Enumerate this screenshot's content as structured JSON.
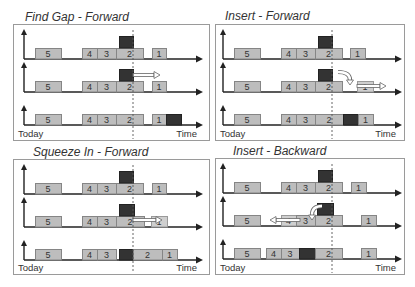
{
  "panels": [
    {
      "id": "find-gap-forward",
      "title": "Find Gap - Forward",
      "today_label": "Today",
      "time_label": "Time",
      "rows": [
        {
          "boxes": [
            {
              "label": "5",
              "x1": 35,
              "x2": 61,
              "type": "task"
            },
            {
              "label": "4",
              "x1": 82,
              "x2": 97,
              "type": "task"
            },
            {
              "label": "3",
              "x1": 97,
              "x2": 116,
              "type": "task"
            },
            {
              "label": "2",
              "x1": 116,
              "x2": 143,
              "type": "task"
            },
            {
              "label": "",
              "x1": 119,
              "x2": 133,
              "type": "new",
              "level": "above"
            },
            {
              "label": "1",
              "x1": 152,
              "x2": 166,
              "type": "task"
            }
          ],
          "arrows": [],
          "curved": []
        },
        {
          "boxes": [
            {
              "label": "5",
              "x1": 35,
              "x2": 61,
              "type": "task"
            },
            {
              "label": "4",
              "x1": 82,
              "x2": 97,
              "type": "task"
            },
            {
              "label": "3",
              "x1": 97,
              "x2": 116,
              "type": "task"
            },
            {
              "label": "2",
              "x1": 116,
              "x2": 143,
              "type": "task"
            },
            {
              "label": "",
              "x1": 119,
              "x2": 133,
              "type": "new",
              "level": "above"
            },
            {
              "label": "1",
              "x1": 152,
              "x2": 166,
              "type": "task"
            }
          ],
          "arrows": [
            {
              "x1": 133,
              "x2": 160,
              "dy": 17,
              "dir": "right"
            }
          ],
          "curved": []
        },
        {
          "boxes": [
            {
              "label": "5",
              "x1": 35,
              "x2": 61,
              "type": "task"
            },
            {
              "label": "4",
              "x1": 82,
              "x2": 97,
              "type": "task"
            },
            {
              "label": "3",
              "x1": 97,
              "x2": 116,
              "type": "task"
            },
            {
              "label": "2",
              "x1": 116,
              "x2": 143,
              "type": "task"
            },
            {
              "label": "1",
              "x1": 152,
              "x2": 166,
              "type": "task"
            },
            {
              "label": "",
              "x1": 166,
              "x2": 181,
              "type": "new"
            }
          ],
          "arrows": [],
          "curved": []
        }
      ]
    },
    {
      "id": "insert-forward",
      "title": "Insert - Forward",
      "today_label": "Today",
      "time_label": "Time",
      "rows": [
        {
          "boxes": [
            {
              "label": "5",
              "x1": 35,
              "x2": 61,
              "type": "task"
            },
            {
              "label": "4",
              "x1": 82,
              "x2": 97,
              "type": "task"
            },
            {
              "label": "3",
              "x1": 97,
              "x2": 116,
              "type": "task"
            },
            {
              "label": "2",
              "x1": 116,
              "x2": 143,
              "type": "task"
            },
            {
              "label": "",
              "x1": 119,
              "x2": 133,
              "type": "new",
              "level": "above"
            },
            {
              "label": "1",
              "x1": 151,
              "x2": 166,
              "type": "task"
            }
          ],
          "arrows": [],
          "curved": []
        },
        {
          "boxes": [
            {
              "label": "5",
              "x1": 35,
              "x2": 61,
              "type": "task"
            },
            {
              "label": "4",
              "x1": 82,
              "x2": 97,
              "type": "task"
            },
            {
              "label": "3",
              "x1": 97,
              "x2": 116,
              "type": "task"
            },
            {
              "label": "2",
              "x1": 116,
              "x2": 143,
              "type": "task"
            },
            {
              "label": "",
              "x1": 119,
              "x2": 133,
              "type": "new",
              "level": "above"
            },
            {
              "label": "1",
              "x1": 158,
              "x2": 174,
              "type": "ghost"
            }
          ],
          "arrows": [
            {
              "x1": 158,
              "x2": 187,
              "dy": 6,
              "dir": "right"
            }
          ],
          "curved": [
            {
              "x1": 139,
              "x2": 151,
              "dy1": 20,
              "dy2": 9,
              "dir": "right"
            }
          ]
        },
        {
          "boxes": [
            {
              "label": "5",
              "x1": 35,
              "x2": 61,
              "type": "task"
            },
            {
              "label": "4",
              "x1": 82,
              "x2": 97,
              "type": "task"
            },
            {
              "label": "3",
              "x1": 97,
              "x2": 116,
              "type": "task"
            },
            {
              "label": "2",
              "x1": 116,
              "x2": 144,
              "type": "task"
            },
            {
              "label": "",
              "x1": 144,
              "x2": 159,
              "type": "new"
            },
            {
              "label": "1",
              "x1": 159,
              "x2": 174,
              "type": "task"
            }
          ],
          "arrows": [],
          "curved": []
        }
      ]
    },
    {
      "id": "squeeze-in-forward",
      "title": "Squeeze In - Forward",
      "today_label": "Today",
      "time_label": "Time",
      "rows": [
        {
          "boxes": [
            {
              "label": "5",
              "x1": 35,
              "x2": 61,
              "type": "task"
            },
            {
              "label": "4",
              "x1": 82,
              "x2": 97,
              "type": "task"
            },
            {
              "label": "3",
              "x1": 97,
              "x2": 116,
              "type": "task"
            },
            {
              "label": "2",
              "x1": 116,
              "x2": 143,
              "type": "task"
            },
            {
              "label": "",
              "x1": 119,
              "x2": 133,
              "type": "new",
              "level": "above"
            },
            {
              "label": "1",
              "x1": 152,
              "x2": 166,
              "type": "task"
            }
          ],
          "arrows": [],
          "curved": []
        },
        {
          "boxes": [
            {
              "label": "5",
              "x1": 35,
              "x2": 61,
              "type": "task"
            },
            {
              "label": "4",
              "x1": 82,
              "x2": 97,
              "type": "task"
            },
            {
              "label": "3",
              "x1": 97,
              "x2": 116,
              "type": "task"
            },
            {
              "label": "2",
              "x1": 116,
              "x2": 144,
              "type": "task"
            },
            {
              "label": "",
              "x1": 119,
              "x2": 134,
              "type": "new",
              "level": "above"
            },
            {
              "label": "1",
              "x1": 151,
              "x2": 167,
              "type": "ghost"
            }
          ],
          "arrows": [
            {
              "x1": 133,
              "x2": 162,
              "dy": 7,
              "dir": "right"
            }
          ],
          "curved": []
        },
        {
          "boxes": [
            {
              "label": "5",
              "x1": 35,
              "x2": 61,
              "type": "task"
            },
            {
              "label": "4",
              "x1": 82,
              "x2": 97,
              "type": "task"
            },
            {
              "label": "3",
              "x1": 97,
              "x2": 116,
              "type": "task"
            },
            {
              "label": "",
              "x1": 119,
              "x2": 133,
              "type": "new"
            },
            {
              "label": "2",
              "x1": 133,
              "x2": 162,
              "type": "task"
            },
            {
              "label": "1",
              "x1": 162,
              "x2": 177,
              "type": "task"
            }
          ],
          "arrows": [],
          "curved": []
        }
      ]
    },
    {
      "id": "insert-backward",
      "title": "Insert - Backward",
      "today_label": "Today",
      "time_label": "Time",
      "rows": [
        {
          "boxes": [
            {
              "label": "5",
              "x1": 35,
              "x2": 61,
              "type": "task"
            },
            {
              "label": "4",
              "x1": 82,
              "x2": 97,
              "type": "task"
            },
            {
              "label": "3",
              "x1": 97,
              "x2": 116,
              "type": "task"
            },
            {
              "label": "2",
              "x1": 116,
              "x2": 143,
              "type": "task"
            },
            {
              "label": "",
              "x1": 119,
              "x2": 133,
              "type": "new",
              "level": "above"
            },
            {
              "label": "1",
              "x1": 152,
              "x2": 167,
              "type": "task"
            }
          ],
          "arrows": [],
          "curved": []
        },
        {
          "boxes": [
            {
              "label": "5",
              "x1": 35,
              "x2": 61,
              "type": "task"
            },
            {
              "label": "4",
              "x1": 82,
              "x2": 97,
              "type": "ghost"
            },
            {
              "label": "3",
              "x1": 97,
              "x2": 116,
              "type": "task"
            },
            {
              "label": "2",
              "x1": 116,
              "x2": 143,
              "type": "task"
            },
            {
              "label": "",
              "x1": 118,
              "x2": 134,
              "type": "new",
              "level": "above"
            },
            {
              "label": "1",
              "x1": 162,
              "x2": 177,
              "type": "task"
            }
          ],
          "arrows": [
            {
              "x1": 101,
              "x2": 71,
              "dy": 6,
              "dir": "left"
            }
          ],
          "curved": [
            {
              "x1": 123,
              "x2": 113,
              "dy1": 20,
              "dy2": 8,
              "dir": "left"
            }
          ]
        },
        {
          "boxes": [
            {
              "label": "5",
              "x1": 35,
              "x2": 61,
              "type": "task"
            },
            {
              "label": "4",
              "x1": 67,
              "x2": 82,
              "type": "task"
            },
            {
              "label": "3",
              "x1": 82,
              "x2": 100,
              "type": "task"
            },
            {
              "label": "",
              "x1": 100,
              "x2": 116,
              "type": "new"
            },
            {
              "label": "2",
              "x1": 116,
              "x2": 143,
              "type": "task"
            },
            {
              "label": "1",
              "x1": 162,
              "x2": 177,
              "type": "task"
            }
          ],
          "arrows": [],
          "curved": []
        }
      ]
    }
  ],
  "colors": {
    "task_fill": "#bdbdbd",
    "task_stroke": "#858585",
    "new_fill": "#333333",
    "new_stroke": "#222222",
    "ghost_fill": "#cfcfcf",
    "ghost_stroke": "#9a9a9a",
    "axis": "#222222",
    "panel_border": "#9a9a9a",
    "current_time_line": "#555555"
  }
}
